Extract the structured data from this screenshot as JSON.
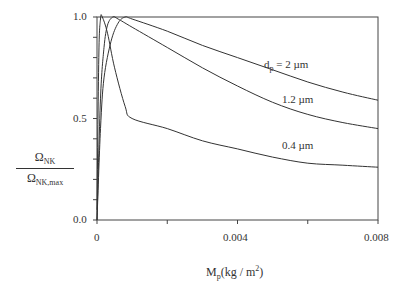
{
  "chart_data": {
    "type": "line",
    "title": "",
    "xlabel": "M_p (kg/m^2)",
    "ylabel": "Ω_NK / Ω_NK,max",
    "xlim": [
      0,
      0.008
    ],
    "ylim": [
      0.0,
      1.0
    ],
    "x_ticks": [
      "0",
      "0.004",
      "0.008"
    ],
    "y_ticks": [
      "0.0",
      "0.5",
      "1.0"
    ],
    "grid": false,
    "legend": "inline labels",
    "series": [
      {
        "name": "d_p = 2 µm",
        "x": [
          0,
          0.0001,
          0.0002,
          0.0004,
          0.0006,
          0.0008,
          0.001,
          0.002,
          0.003,
          0.004,
          0.005,
          0.006,
          0.007,
          0.008
        ],
        "y": [
          0.0,
          0.45,
          0.7,
          0.88,
          0.97,
          1.0,
          0.99,
          0.93,
          0.86,
          0.8,
          0.74,
          0.68,
          0.63,
          0.59
        ]
      },
      {
        "name": "1.2 µm",
        "x": [
          0,
          0.0001,
          0.0002,
          0.0003,
          0.00045,
          0.0006,
          0.001,
          0.002,
          0.003,
          0.004,
          0.005,
          0.006,
          0.007,
          0.008
        ],
        "y": [
          0.0,
          0.6,
          0.85,
          0.96,
          1.0,
          0.99,
          0.95,
          0.85,
          0.75,
          0.66,
          0.58,
          0.52,
          0.48,
          0.45
        ]
      },
      {
        "name": "0.4 µm",
        "x": [
          0,
          5e-05,
          0.0001,
          0.00015,
          0.0003,
          0.0005,
          0.0008,
          0.001,
          0.002,
          0.003,
          0.004,
          0.005,
          0.006,
          0.007,
          0.008
        ],
        "y": [
          0.05,
          0.8,
          0.99,
          1.0,
          0.92,
          0.75,
          0.56,
          0.5,
          0.45,
          0.39,
          0.35,
          0.31,
          0.28,
          0.27,
          0.26
        ]
      }
    ]
  },
  "labels": {
    "series_2um": "d",
    "series_2um_sub": "p",
    "series_2um_rest": " = 2 µm",
    "series_1_2um": "1.2 µm",
    "series_0_4um": "0.4 µm",
    "ytick_1": "1.0",
    "ytick_05": "0.5",
    "ytick_0": "0.0",
    "xtick_0": "0",
    "xtick_0004": "0.004",
    "xtick_0008": "0.008",
    "ylabel_num": "Ω",
    "ylabel_num_sub": "NK",
    "ylabel_den": "Ω",
    "ylabel_den_sub": "NK,max",
    "xlabel_main": "M",
    "xlabel_sub": "p",
    "xlabel_unit": "(kg / m",
    "xlabel_sup": "2",
    "xlabel_close": ")"
  }
}
